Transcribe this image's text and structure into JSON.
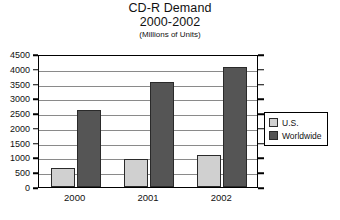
{
  "chart_data": {
    "type": "bar",
    "title": "CD-R Demand",
    "subtitle": "2000-2002",
    "units_note": "(Millions of Units)",
    "xlabel": "",
    "ylabel": "",
    "categories": [
      "2000",
      "2001",
      "2002"
    ],
    "series": [
      {
        "name": "U.S.",
        "color": "#d0d0d0",
        "values": [
          650,
          950,
          1100
        ]
      },
      {
        "name": "Worldwide",
        "color": "#555555",
        "values": [
          2600,
          3550,
          4050
        ]
      }
    ],
    "ylim": [
      0,
      4500
    ],
    "ytick_step": 500,
    "yticks": [
      0,
      500,
      1000,
      1500,
      2000,
      2500,
      3000,
      3500,
      4000,
      4500
    ],
    "ytick_labels": [
      "0",
      "500",
      "1000",
      "1500",
      "2000",
      "2500",
      "3000",
      "3500",
      "4000",
      "4500"
    ],
    "grid": true,
    "grid_axis": "y",
    "legend_position": "right-outside",
    "legend_entries": [
      "U.S.",
      "Worldwide"
    ]
  }
}
